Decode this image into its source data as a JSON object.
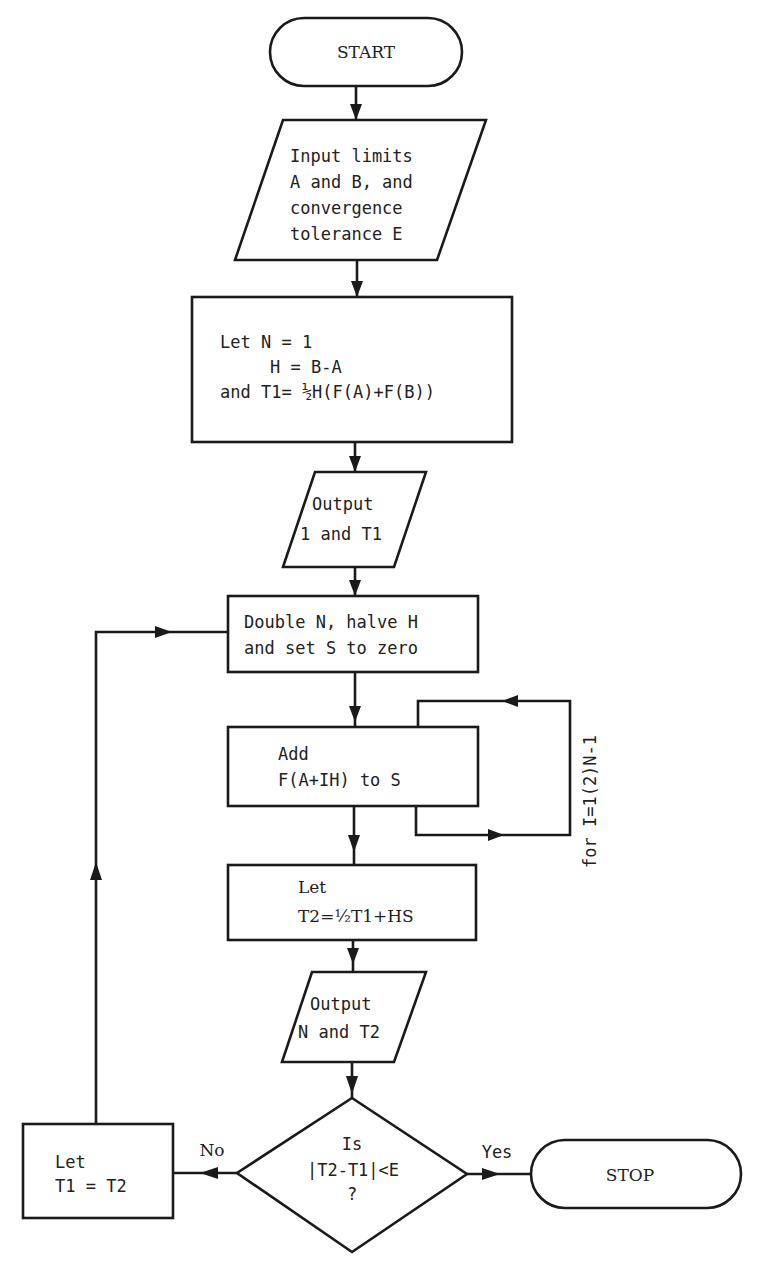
{
  "diagram": {
    "type": "flowchart",
    "nodes": {
      "start": {
        "kind": "terminator",
        "text": "START"
      },
      "input": {
        "kind": "io",
        "lines": [
          "Input limits",
          "A and B, and",
          "convergence",
          "tolerance E"
        ]
      },
      "init": {
        "kind": "process",
        "lines": [
          "Let N = 1",
          "H = B-A",
          "and T1= ½H(F(A)+F(B))"
        ]
      },
      "output1": {
        "kind": "io",
        "lines": [
          "Output",
          "1 and T1"
        ]
      },
      "double": {
        "kind": "process",
        "lines": [
          "Double N, halve H",
          "and set S to zero"
        ]
      },
      "add": {
        "kind": "process",
        "lines": [
          "Add",
          "F(A+IH) to S"
        ]
      },
      "loop_label": "for I=1(2)N-1",
      "let_t2": {
        "kind": "process",
        "lines": [
          "Let",
          "T2=½T1+HS"
        ]
      },
      "output2": {
        "kind": "io",
        "lines": [
          "Output",
          "N and T2"
        ]
      },
      "decision": {
        "kind": "decision",
        "lines": [
          "Is",
          "|T2-T1|<E",
          "?"
        ]
      },
      "let_t1": {
        "kind": "process",
        "lines": [
          "Let",
          "T1 = T2"
        ]
      },
      "stop": {
        "kind": "terminator",
        "text": "STOP"
      }
    },
    "edges": {
      "no_label": "No",
      "yes_label": "Yes"
    }
  }
}
